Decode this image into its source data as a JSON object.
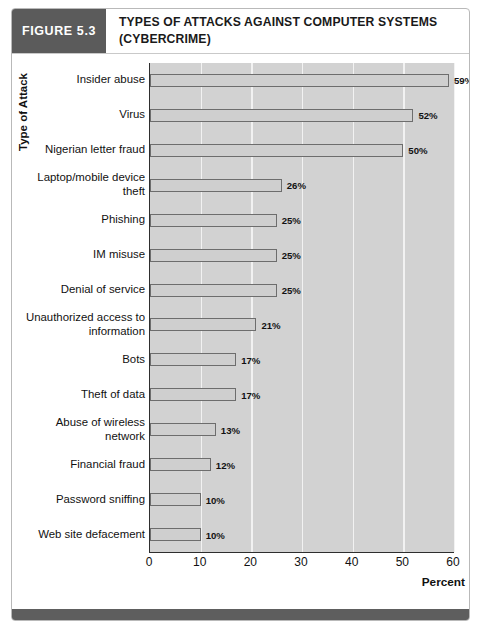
{
  "figure": {
    "number_label": "FIGURE 5.3",
    "title": "TYPES OF ATTACKS AGAINST COMPUTER SYSTEMS (CYBERCRIME)"
  },
  "colors": {
    "figure_number_bg": "#5b5b5b",
    "footer_bar": "#5e5e5e",
    "plot_bg": "#d2d2d2",
    "gridline": "#f2f2f2",
    "bar_fill": "#cfcfcf",
    "bar_border": "#6d6d6d",
    "axis": "#2e2e2e"
  },
  "chart_data": {
    "type": "bar",
    "orientation": "horizontal",
    "title": "TYPES OF ATTACKS AGAINST COMPUTER SYSTEMS (CYBERCRIME)",
    "xlabel": "Percent",
    "ylabel": "Type of Attack",
    "xlim": [
      0,
      60
    ],
    "xticks": [
      0,
      10,
      20,
      30,
      40,
      50,
      60
    ],
    "xtick_labels": [
      "0",
      "10",
      "20",
      "30",
      "40",
      "50",
      "60"
    ],
    "grid": "vertical",
    "legend": "none",
    "value_label_suffix": "%",
    "categories": [
      "Insider abuse",
      "Virus",
      "Nigerian letter fraud",
      "Laptop/mobile device theft",
      "Phishing",
      "IM misuse",
      "Denial of service",
      "Unauthorized access to information",
      "Bots",
      "Theft of data",
      "Abuse of wireless network",
      "Financial fraud",
      "Password sniffing",
      "Web site defacement"
    ],
    "category_label_lines": [
      [
        "Insider abuse"
      ],
      [
        "Virus"
      ],
      [
        "Nigerian letter fraud"
      ],
      [
        "Laptop/mobile device",
        "theft"
      ],
      [
        "Phishing"
      ],
      [
        "IM misuse"
      ],
      [
        "Denial of service"
      ],
      [
        "Unauthorized access to",
        "information"
      ],
      [
        "Bots"
      ],
      [
        "Theft of data"
      ],
      [
        "Abuse of wireless",
        "network"
      ],
      [
        "Financial fraud"
      ],
      [
        "Password sniffing"
      ],
      [
        "Web site defacement"
      ]
    ],
    "values": [
      59,
      52,
      50,
      26,
      25,
      25,
      25,
      21,
      17,
      17,
      13,
      12,
      10,
      10
    ],
    "value_labels": [
      "59%",
      "52%",
      "50%",
      "26%",
      "25%",
      "25%",
      "25%",
      "21%",
      "17%",
      "17%",
      "13%",
      "12%",
      "10%",
      "10%"
    ]
  }
}
